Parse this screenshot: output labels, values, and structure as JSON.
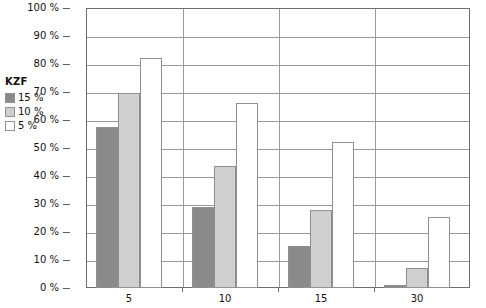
{
  "chart_data": {
    "type": "bar",
    "title": "",
    "xlabel": "",
    "ylabel": "",
    "categories": [
      "5",
      "10",
      "15",
      "30"
    ],
    "ylim": [
      0,
      100
    ],
    "y_ticks": [
      0,
      10,
      20,
      30,
      40,
      50,
      60,
      70,
      80,
      90,
      100
    ],
    "y_tick_labels": [
      "0 %",
      "10 %",
      "20 %",
      "30 %",
      "40 %",
      "50 %",
      "60 %",
      "70 %",
      "80 %",
      "90 %",
      "100 %"
    ],
    "grid": true,
    "legend_position": "left-outside",
    "series": [
      {
        "name": "15 %",
        "color": "#8a8a8a",
        "values": [
          57.5,
          29,
          15,
          1
        ]
      },
      {
        "name": "10 %",
        "color": "#cfcfcf",
        "values": [
          69.5,
          43.5,
          28,
          7
        ]
      },
      {
        "name": "5 %",
        "color": "#ffffff",
        "values": [
          82,
          66,
          52,
          25.5
        ]
      }
    ]
  },
  "legend": {
    "title": "KZF",
    "items": [
      {
        "label": "15 %",
        "color": "#8a8a8a"
      },
      {
        "label": "10 %",
        "color": "#cfcfcf"
      },
      {
        "label": "5 %",
        "color": "#ffffff"
      }
    ]
  },
  "axes": {
    "y_tick_labels": [
      "100 %",
      "90 %",
      "80 %",
      "70 %",
      "60 %",
      "50 %",
      "40 %",
      "30 %",
      "20 %",
      "10 %",
      "0 %"
    ],
    "x_tick_labels": [
      "5",
      "10",
      "15",
      "30"
    ]
  },
  "colors": {
    "series_dark": "#8a8a8a",
    "series_light": "#cfcfcf",
    "series_white": "#ffffff",
    "bar_border": "#8f8f8f",
    "gridline": "#9a9a9a",
    "frame": "#6e6e6e",
    "text": "#111111",
    "background": "#ffffff"
  }
}
